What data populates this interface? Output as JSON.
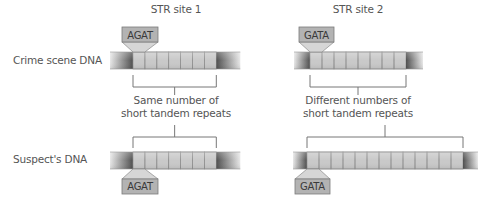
{
  "row_labels": {
    "crime": "Crime scene DNA",
    "suspect": "Suspect's DNA"
  },
  "sites": [
    {
      "title": "STR site 1",
      "title_x": 176,
      "repeat_unit": "AGAT",
      "caption_line1": "Same number of",
      "caption_line2": "short tandem repeats",
      "caption_x": 176,
      "crime": {
        "bar_left": 110,
        "flank_left": 23,
        "repeats": 7,
        "cell_w": 11.9,
        "flank_right": 24,
        "y": 52
      },
      "suspect": {
        "bar_left": 110,
        "flank_left": 23,
        "repeats": 7,
        "cell_w": 11.9,
        "flank_right": 24,
        "y": 152
      },
      "tag_top": {
        "box_x": 122,
        "box_w": 36
      },
      "tag_bottom": {
        "box_x": 122,
        "box_w": 36
      }
    },
    {
      "title": "STR site 2",
      "title_x": 358,
      "repeat_unit": "GATA",
      "caption_line1": "Different numbers of",
      "caption_line2": "short tandem repeats",
      "caption_x": 358,
      "crime": {
        "bar_left": 294,
        "flank_left": 16,
        "repeats": 8,
        "cell_w": 12,
        "flank_right": 17,
        "y": 52
      },
      "suspect": {
        "bar_left": 293,
        "flank_left": 14,
        "repeats": 13,
        "cell_w": 12,
        "flank_right": 15,
        "y": 152
      },
      "tag_top": {
        "box_x": 299,
        "box_w": 35
      },
      "tag_bottom": {
        "box_x": 295,
        "box_w": 35
      }
    }
  ],
  "colors": {
    "repeat_fill": "#c9c9c9",
    "repeat_stroke": "#8f8f8f",
    "flank_dark": "#555555",
    "flank_light": "#e6e6e6",
    "tag_fill": "#b3b3b3",
    "tag_stroke": "#7a7a7a",
    "tag_neck": "#d6d6d6",
    "bracket": "#777777"
  }
}
